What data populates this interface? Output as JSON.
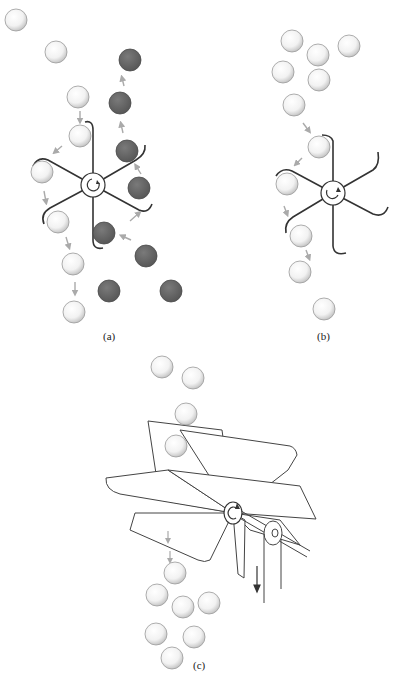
{
  "figure": {
    "panels": [
      {
        "id": "a",
        "caption": "(a)",
        "caption_pos": [
          103,
          338
        ],
        "hub": {
          "cx": 93,
          "cy": 185,
          "r": 12
        },
        "white_balls": [
          [
            16,
            20
          ],
          [
            56,
            52
          ],
          [
            78,
            97
          ],
          [
            80,
            136
          ],
          [
            42,
            172
          ],
          [
            58,
            222
          ],
          [
            73,
            264
          ],
          [
            74,
            312
          ]
        ],
        "dark_balls": [
          [
            130,
            60
          ],
          [
            120,
            103
          ],
          [
            127,
            151
          ],
          [
            139,
            188
          ],
          [
            104,
            233
          ],
          [
            146,
            256
          ],
          [
            109,
            291
          ],
          [
            171,
            291
          ]
        ],
        "color_white_ball": "#f4f4f4",
        "color_dark_ball": "#6a6a6a"
      },
      {
        "id": "b",
        "caption": "(b)",
        "caption_pos": [
          317,
          338
        ],
        "hub": {
          "cx": 333,
          "cy": 193,
          "r": 12
        },
        "white_balls": [
          [
            292,
            41
          ],
          [
            318,
            55
          ],
          [
            349,
            46
          ],
          [
            283,
            72
          ],
          [
            319,
            80
          ],
          [
            294,
            105
          ],
          [
            319,
            147
          ],
          [
            287,
            184
          ],
          [
            301,
            236
          ],
          [
            324,
            309
          ],
          [
            300,
            272
          ]
        ],
        "dark_balls": []
      },
      {
        "id": "c",
        "caption": "(c)",
        "caption_pos": [
          193,
          667
        ],
        "hub": {
          "cx": 233,
          "cy": 513,
          "r": 10
        },
        "white_balls": [
          [
            162,
            367
          ],
          [
            193,
            378
          ],
          [
            186,
            414
          ],
          [
            176,
            446
          ],
          [
            175,
            573
          ],
          [
            157,
            595
          ],
          [
            183,
            607
          ],
          [
            209,
            603
          ],
          [
            156,
            634
          ],
          [
            194,
            637
          ],
          [
            172,
            658
          ]
        ],
        "dark_balls": []
      }
    ],
    "stroke_color": "#333333",
    "arrow_color": "#aaaaaa"
  }
}
